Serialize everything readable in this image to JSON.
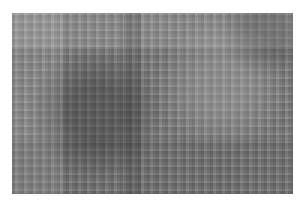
{
  "image": {
    "description": "Grayscale, heavily pixelated/noisy photograph with no visible text",
    "dominant_color": "#808080"
  }
}
